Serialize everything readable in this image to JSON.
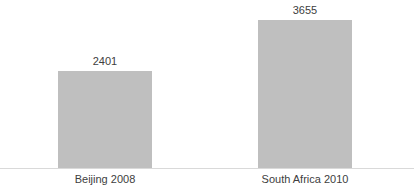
{
  "chart_data": {
    "type": "bar",
    "title": "SOUTH AFRICA 2010",
    "xlabel": "",
    "ylabel": "",
    "categories": [
      "Beijing 2008",
      "South Africa 2010"
    ],
    "values": [
      2401,
      3655
    ],
    "value_labels": [
      "2401",
      "3655"
    ],
    "ylim": [
      0,
      4120
    ],
    "grid": false,
    "legend": null,
    "bar_color": "#bfbfbf",
    "axis_color": "#d9d9d9",
    "text_color": "#404040",
    "title_color": "#3a3a3a"
  },
  "bars": [
    {
      "label": "Beijing 2008",
      "value": 2401,
      "value_label": "2401"
    },
    {
      "label": "South Africa 2010",
      "value": 3655,
      "value_label": "3655"
    }
  ]
}
